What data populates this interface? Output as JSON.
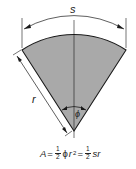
{
  "diagram": {
    "labels": {
      "arc": "s",
      "radius": "r",
      "angle": "ϕ"
    },
    "formula": {
      "lhs": "A",
      "eq": "=",
      "frac_num": "1",
      "frac_den": "2",
      "term1_symbol": "ϕ",
      "term1_var": "r",
      "term1_exp": "2",
      "term2_var": "sr"
    },
    "colors": {
      "fill": "#a9a9a9",
      "stroke": "#1a1a1a"
    }
  }
}
